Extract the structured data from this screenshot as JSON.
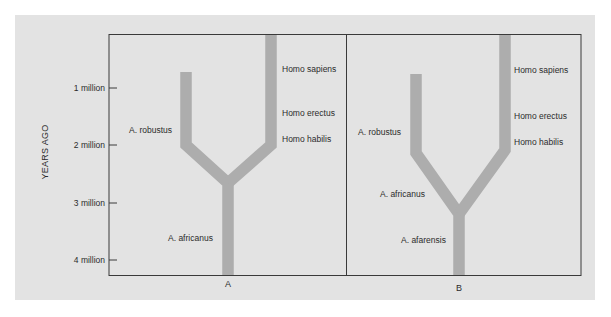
{
  "figure": {
    "y_axis_label": "YEARS AGO",
    "y_ticks": [
      "1 million",
      "2 million",
      "3 million",
      "4 million"
    ],
    "panels": [
      {
        "id": "A",
        "label": "A",
        "species_labels": {
          "robustus": "A. robustus",
          "sapiens": "Homo sapiens",
          "erectus": "Homo erectus",
          "habilis": "Homo habilis",
          "africanus": "A. africanus"
        }
      },
      {
        "id": "B",
        "label": "B",
        "species_labels": {
          "robustus": "A. robustus",
          "sapiens": "Homo sapiens",
          "erectus": "Homo erectus",
          "habilis": "Homo habilis",
          "africanus": "A. africanus",
          "afarensis": "A. afarensis"
        }
      }
    ],
    "colors": {
      "panel_bg": "#e3e3e3",
      "branch": "#adadad",
      "frame": "#3a3a3a"
    }
  }
}
